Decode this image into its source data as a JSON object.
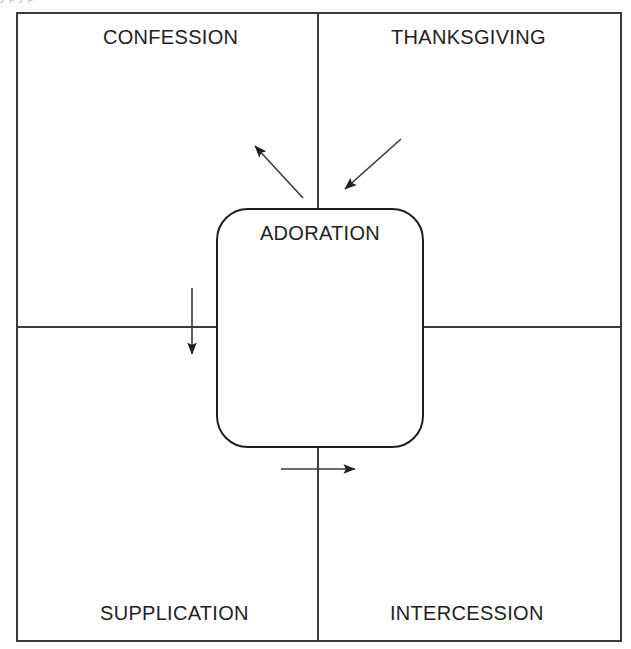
{
  "figure": {
    "type": "quadrant-diagram",
    "title_text_partial_top_bleed": "y  p y p",
    "center": {
      "label": "ADORATION",
      "shape": "rounded-rectangle"
    },
    "quadrants": [
      {
        "position": "top-left",
        "label": "CONFESSION"
      },
      {
        "position": "top-right",
        "label": "THANKSGIVING"
      },
      {
        "position": "bottom-left",
        "label": "SUPPLICATION"
      },
      {
        "position": "bottom-right",
        "label": "INTERCESSION"
      }
    ],
    "arrows": [
      {
        "name": "arrow-to-confession",
        "direction": "up-left",
        "points_toward": "CONFESSION"
      },
      {
        "name": "arrow-from-thanksgiving",
        "direction": "down-left",
        "points_toward": "ADORATION"
      },
      {
        "name": "arrow-to-supplication",
        "direction": "down",
        "points_toward": "SUPPLICATION"
      },
      {
        "name": "arrow-to-intercession",
        "direction": "right",
        "points_toward": "INTERCESSION"
      }
    ],
    "colors": {
      "line": "#3a3a3c",
      "box_line": "#1f1f21",
      "text": "#222224",
      "background": "#ffffff"
    }
  }
}
